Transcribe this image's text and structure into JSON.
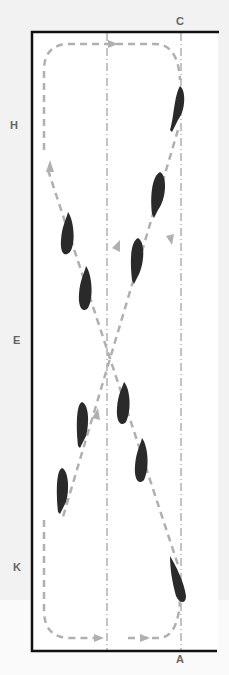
{
  "diagram": {
    "letters": [
      {
        "id": "C",
        "label": "C",
        "x": 176,
        "y": 15
      },
      {
        "id": "H",
        "label": "H",
        "x": 10,
        "y": 119
      },
      {
        "id": "E",
        "label": "E",
        "x": 13,
        "y": 334
      },
      {
        "id": "K",
        "label": "K",
        "x": 13,
        "y": 561
      },
      {
        "id": "A",
        "label": "A",
        "x": 176,
        "y": 653
      }
    ],
    "colors": {
      "background": "#f2f2f2",
      "arena_fill": "#ffffff",
      "border": "#111111",
      "path": "#b0b0b0",
      "guide_line": "#888888",
      "horse": "#2a2a2a",
      "letter": "#666666"
    },
    "horse_count": 10
  }
}
